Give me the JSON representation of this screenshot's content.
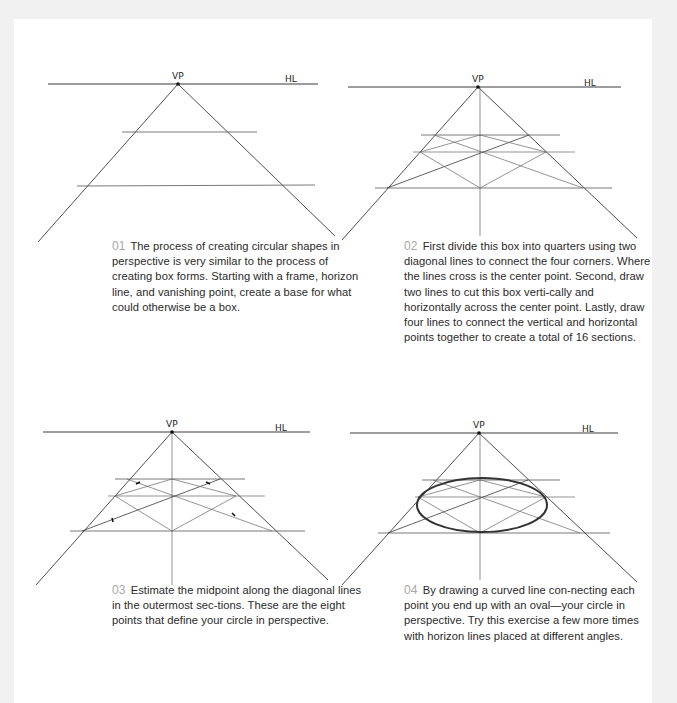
{
  "page": {
    "background": "#ffffff",
    "margin_color": "#f1f1f1"
  },
  "labels": {
    "vanishing_point": "VP",
    "horizon_line": "HL"
  },
  "steps": [
    {
      "number": "01",
      "text": "The process of creating circular shapes in perspective is very similar to the process of creating box forms. Starting with a frame, horizon line, and vanishing point, create a base for what could otherwise be a box."
    },
    {
      "number": "02",
      "text": "First divide this box into quarters using two diagonal lines to connect the four corners. Where the lines cross is the center point. Second, draw two lines to cut this box verti-cally and horizontally across the center point. Lastly, draw four lines to connect the vertical and horizontal points together to create a total of 16 sections."
    },
    {
      "number": "03",
      "text": "Estimate the midpoint along the diagonal lines in the outermost sec-tions. These are the eight points that define your circle in perspective."
    },
    {
      "number": "04",
      "text": "By drawing a curved line con-necting each point you end up with an oval—your circle in perspective. Try this exercise a few more times with horizon lines placed at different angles."
    }
  ]
}
